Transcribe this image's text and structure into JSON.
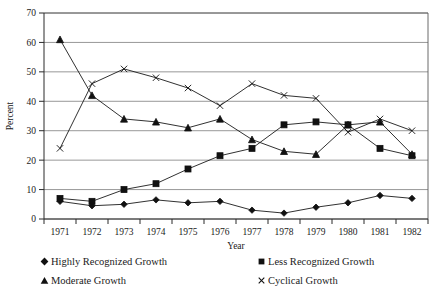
{
  "chart_data": {
    "type": "line",
    "title": "",
    "xlabel": "Year",
    "ylabel": "Percent",
    "categories": [
      1971,
      1972,
      1973,
      1974,
      1975,
      1976,
      1977,
      1978,
      1979,
      1980,
      1981,
      1982
    ],
    "ylim": [
      0,
      70
    ],
    "ytick_values": [
      0,
      10,
      20,
      30,
      40,
      50,
      60,
      70
    ],
    "grid": "horizontal",
    "legend_position": "bottom",
    "series": [
      {
        "name": "Highly Recognized Growth",
        "marker": "diamond",
        "values": [
          6,
          4.5,
          5,
          6.5,
          5.5,
          6,
          3,
          2,
          4,
          5.5,
          8,
          7
        ]
      },
      {
        "name": "Moderate Growth",
        "marker": "triangle",
        "values": [
          61,
          42,
          34,
          33,
          31,
          34,
          27,
          23,
          22,
          32,
          33,
          22
        ]
      },
      {
        "name": "Less Recognized Growth",
        "marker": "square",
        "values": [
          7,
          6,
          10,
          12,
          17,
          21.5,
          24,
          32,
          33,
          32,
          24,
          21.5
        ]
      },
      {
        "name": "Cyclical Growth",
        "marker": "cross",
        "values": [
          24,
          46,
          51,
          48,
          44.5,
          38.5,
          46,
          42,
          41,
          29.5,
          34,
          30
        ]
      }
    ]
  },
  "legend": {
    "entries": [
      {
        "label": "Highly Recognized Growth",
        "marker": "diamond"
      },
      {
        "label": "Moderate Growth",
        "marker": "triangle"
      },
      {
        "label": "Less Recognized Growth",
        "marker": "square"
      },
      {
        "label": "Cyclical Growth",
        "marker": "cross"
      }
    ]
  }
}
